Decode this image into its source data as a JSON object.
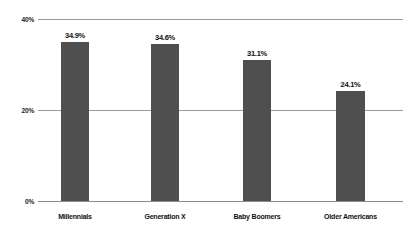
{
  "chart_data": {
    "type": "bar",
    "title": "",
    "subtitle": "",
    "xlabel": "",
    "ylabel": "",
    "categories": [
      "Millennials",
      "Generation X",
      "Baby Boomers",
      "Older Americans"
    ],
    "values": [
      34.9,
      34.6,
      31.1,
      24.1
    ],
    "value_labels": [
      "34.9%",
      "34.6%",
      "31.1%",
      "24.1%"
    ],
    "ylim": [
      0,
      40
    ],
    "yticks": [
      0,
      20,
      40
    ],
    "ytick_labels": [
      "0%",
      "20%",
      "40%"
    ],
    "grid": true,
    "legend": false,
    "legend_position": "none",
    "bar_color": "#4f4f4f",
    "gridline_color": "#9a9a9a",
    "background_color": "#ffffff",
    "text_color": "#111111"
  }
}
